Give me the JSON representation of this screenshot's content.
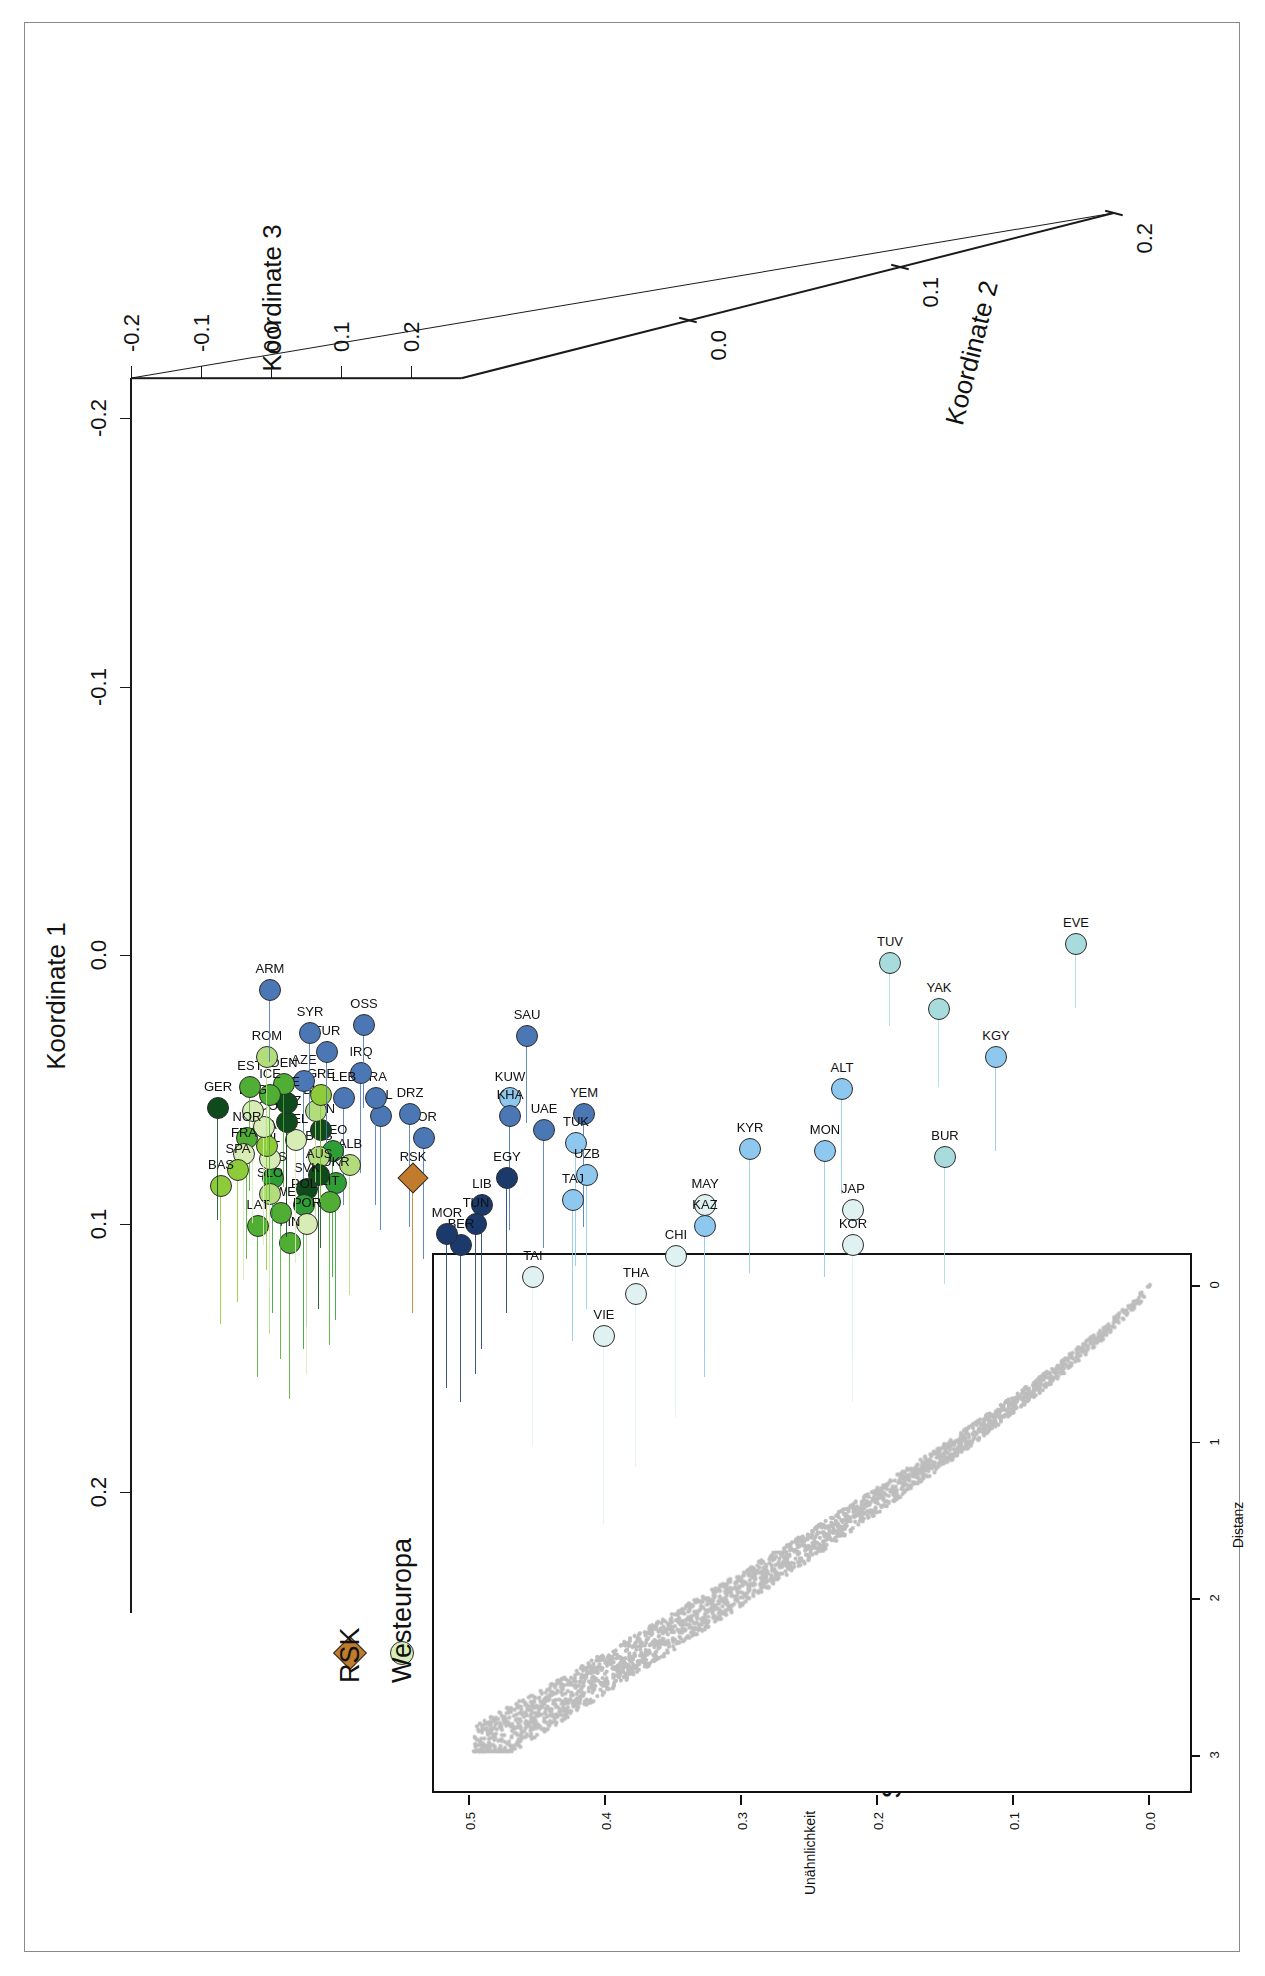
{
  "panel": {
    "letter": "b"
  },
  "axes": {
    "x_title": "Koordinate 1",
    "y_title": "Koordinate 2",
    "z_title": "Koordinate 3",
    "x_ticks": [
      "-0.2",
      "-0.1",
      "0.0",
      "0.1",
      "0.2"
    ],
    "y_ticks": [
      "0.0",
      "0.1",
      "0.2"
    ],
    "z_ticks": [
      "-0.2",
      "-0.1",
      "0.0",
      "0.1",
      "0.2"
    ]
  },
  "inset": {
    "stress_label": "Stress – 0.09158",
    "x_title": "Unähnlichkeit",
    "y_title": "Distanz",
    "x_ticks": [
      "0.0",
      "0.1",
      "0.2",
      "0.3",
      "0.4",
      "0.5"
    ],
    "y_ticks": [
      "0",
      "1",
      "2",
      "3"
    ]
  },
  "legend": {
    "items": [
      {
        "label": "Nordafrika",
        "color": "#1b3a6b"
      },
      {
        "label": "Südwestasien",
        "color": "#4b77b5"
      },
      {
        "label": "Zentralasien",
        "color": "#8ec8ef"
      },
      {
        "label": "Nordasien",
        "color": "#a8dcdc"
      },
      {
        "label": "Südostasien",
        "color": "#dff1f1"
      },
      {
        "label": "Zentraleuropa",
        "color": "#0f4a1c"
      },
      {
        "label": "Osteuropa",
        "color": "#2f9e35"
      },
      {
        "label": "Nordeuropa",
        "color": "#4fae33"
      },
      {
        "label": "Südeuropa",
        "color": "#8dcb3a"
      },
      {
        "label": "Südosteuropa",
        "color": "#b3dd7d"
      },
      {
        "label": "Westeuropa",
        "color": "#d8edb6"
      },
      {
        "label": "RSK",
        "color": "#c07b2c",
        "shape": "diamond"
      }
    ]
  },
  "chart_data": {
    "type": "scatter",
    "title": "",
    "xlabel": "Koordinate 1",
    "ylabel": "Koordinate 2",
    "zlabel": "Koordinate 3",
    "xlim": [
      -0.22,
      0.28
    ],
    "ylim": [
      -0.06,
      0.215
    ],
    "grid": false,
    "legend_position": "bottom-left",
    "points": [
      {
        "code": "EVE",
        "x": -0.004,
        "y": 0.196,
        "group": "Nordasien"
      },
      {
        "code": "KGY",
        "x": 0.038,
        "y": 0.168,
        "group": "Zentralasien"
      },
      {
        "code": "YAK",
        "x": 0.02,
        "y": 0.148,
        "group": "Nordasien"
      },
      {
        "code": "TUV",
        "x": 0.003,
        "y": 0.131,
        "group": "Nordasien"
      },
      {
        "code": "BUR",
        "x": 0.075,
        "y": 0.15,
        "group": "Nordasien"
      },
      {
        "code": "ALT",
        "x": 0.05,
        "y": 0.114,
        "group": "Zentralasien"
      },
      {
        "code": "MON",
        "x": 0.073,
        "y": 0.108,
        "group": "Zentralasien"
      },
      {
        "code": "JAP",
        "x": 0.095,
        "y": 0.118,
        "group": "Südostasien"
      },
      {
        "code": "KOR",
        "x": 0.108,
        "y": 0.118,
        "group": "Südostasien"
      },
      {
        "code": "KYR",
        "x": 0.072,
        "y": 0.082,
        "group": "Zentralasien"
      },
      {
        "code": "MAY",
        "x": 0.093,
        "y": 0.066,
        "group": "Südostasien"
      },
      {
        "code": "KAZ",
        "x": 0.101,
        "y": 0.066,
        "group": "Zentralasien"
      },
      {
        "code": "CHI",
        "x": 0.112,
        "y": 0.056,
        "group": "Südostasien"
      },
      {
        "code": "THA",
        "x": 0.126,
        "y": 0.042,
        "group": "Südostasien"
      },
      {
        "code": "VIE",
        "x": 0.142,
        "y": 0.031,
        "group": "Südostasien"
      },
      {
        "code": "YEM",
        "x": 0.059,
        "y": 0.024,
        "group": "Südwestasien"
      },
      {
        "code": "TUK",
        "x": 0.07,
        "y": 0.021,
        "group": "Zentralasien"
      },
      {
        "code": "UZB",
        "x": 0.082,
        "y": 0.025,
        "group": "Zentralasien"
      },
      {
        "code": "TAJ",
        "x": 0.091,
        "y": 0.02,
        "group": "Zentralasien"
      },
      {
        "code": "UAE",
        "x": 0.065,
        "y": 0.01,
        "group": "Südwestasien"
      },
      {
        "code": "SAU",
        "x": 0.03,
        "y": 0.004,
        "group": "Südwestasien"
      },
      {
        "code": "TAI",
        "x": 0.12,
        "y": 0.006,
        "group": "Südostasien"
      },
      {
        "code": "KUW",
        "x": 0.053,
        "y": -0.002,
        "group": "Zentralasien"
      },
      {
        "code": "KHA",
        "x": 0.06,
        "y": -0.002,
        "group": "Südwestasien"
      },
      {
        "code": "EGY",
        "x": 0.083,
        "y": -0.003,
        "group": "Nordafrika"
      },
      {
        "code": "LIB",
        "x": 0.093,
        "y": -0.012,
        "group": "Nordafrika"
      },
      {
        "code": "TUN",
        "x": 0.1,
        "y": -0.014,
        "group": "Nordafrika"
      },
      {
        "code": "BER",
        "x": 0.108,
        "y": -0.019,
        "group": "Nordafrika"
      },
      {
        "code": "MOR",
        "x": 0.104,
        "y": -0.024,
        "group": "Nordafrika"
      },
      {
        "code": "JOR",
        "x": 0.068,
        "y": -0.032,
        "group": "Südwestasien"
      },
      {
        "code": "DRZ",
        "x": 0.059,
        "y": -0.037,
        "group": "Südwestasien"
      },
      {
        "code": "RSK",
        "x": 0.083,
        "y": -0.036,
        "group": "RSK",
        "shape": "diamond"
      },
      {
        "code": "PAL",
        "x": 0.06,
        "y": -0.047,
        "group": "Südwestasien"
      },
      {
        "code": "IRA",
        "x": 0.053,
        "y": -0.049,
        "group": "Südwestasien"
      },
      {
        "code": "IRQ",
        "x": 0.044,
        "y": -0.054,
        "group": "Südwestasien"
      },
      {
        "code": "OSS",
        "x": 0.026,
        "y": -0.053,
        "group": "Südwestasien"
      },
      {
        "code": "LEB",
        "x": 0.053,
        "y": -0.06,
        "group": "Südwestasien"
      },
      {
        "code": "ALB",
        "x": 0.078,
        "y": -0.058,
        "group": "Südosteuropa"
      },
      {
        "code": "GEO",
        "x": 0.073,
        "y": -0.064,
        "group": "Osteuropa"
      },
      {
        "code": "UKR",
        "x": 0.085,
        "y": -0.063,
        "group": "Osteuropa"
      },
      {
        "code": "LIT",
        "x": 0.092,
        "y": -0.065,
        "group": "Nordeuropa"
      },
      {
        "code": "BOS",
        "x": 0.075,
        "y": -0.069,
        "group": "Südosteuropa"
      },
      {
        "code": "AUS",
        "x": 0.082,
        "y": -0.069,
        "group": "Zentraleuropa"
      },
      {
        "code": "HUN",
        "x": 0.065,
        "y": -0.068,
        "group": "Zentraleuropa"
      },
      {
        "code": "BUL",
        "x": 0.058,
        "y": -0.07,
        "group": "Südosteuropa"
      },
      {
        "code": "GRE",
        "x": 0.052,
        "y": -0.068,
        "group": "Südeuropa"
      },
      {
        "code": "TUR",
        "x": 0.036,
        "y": -0.066,
        "group": "Südwestasien"
      },
      {
        "code": "AZE",
        "x": 0.047,
        "y": -0.074,
        "group": "Südwestasien"
      },
      {
        "code": "SYR",
        "x": 0.029,
        "y": -0.072,
        "group": "Südwestasien"
      },
      {
        "code": "SVK",
        "x": 0.087,
        "y": -0.073,
        "group": "Zentraleuropa"
      },
      {
        "code": "POL",
        "x": 0.093,
        "y": -0.074,
        "group": "Osteuropa"
      },
      {
        "code": "POR",
        "x": 0.1,
        "y": -0.073,
        "group": "Westeuropa"
      },
      {
        "code": "FIN",
        "x": 0.107,
        "y": -0.079,
        "group": "Nordeuropa"
      },
      {
        "code": "BEL",
        "x": 0.069,
        "y": -0.077,
        "group": "Westeuropa"
      },
      {
        "code": "SWZ",
        "x": 0.062,
        "y": -0.08,
        "group": "Zentraleuropa"
      },
      {
        "code": "CZE",
        "x": 0.055,
        "y": -0.08,
        "group": "Zentraleuropa"
      },
      {
        "code": "DEN",
        "x": 0.048,
        "y": -0.081,
        "group": "Nordeuropa"
      },
      {
        "code": "SWE",
        "x": 0.096,
        "y": -0.082,
        "group": "Nordeuropa"
      },
      {
        "code": "RUS",
        "x": 0.083,
        "y": -0.085,
        "group": "Osteuropa"
      },
      {
        "code": "SLO",
        "x": 0.089,
        "y": -0.086,
        "group": "Südosteuropa"
      },
      {
        "code": "LAT",
        "x": 0.101,
        "y": -0.09,
        "group": "Nordeuropa"
      },
      {
        "code": "IRL",
        "x": 0.076,
        "y": -0.086,
        "group": "Westeuropa"
      },
      {
        "code": "ITA",
        "x": 0.071,
        "y": -0.087,
        "group": "Südeuropa"
      },
      {
        "code": "SCO",
        "x": 0.064,
        "y": -0.088,
        "group": "Westeuropa"
      },
      {
        "code": "ICE",
        "x": 0.052,
        "y": -0.086,
        "group": "Nordeuropa"
      },
      {
        "code": "ENG",
        "x": 0.058,
        "y": -0.092,
        "group": "Westeuropa"
      },
      {
        "code": "EST",
        "x": 0.049,
        "y": -0.093,
        "group": "Nordeuropa"
      },
      {
        "code": "ROM",
        "x": 0.038,
        "y": -0.087,
        "group": "Südosteuropa"
      },
      {
        "code": "ARM",
        "x": 0.013,
        "y": -0.086,
        "group": "Südwestasien"
      },
      {
        "code": "NOR",
        "x": 0.068,
        "y": -0.094,
        "group": "Nordeuropa"
      },
      {
        "code": "FRA",
        "x": 0.074,
        "y": -0.095,
        "group": "Westeuropa"
      },
      {
        "code": "SPA",
        "x": 0.08,
        "y": -0.097,
        "group": "Südeuropa"
      },
      {
        "code": "BAS",
        "x": 0.086,
        "y": -0.103,
        "group": "Südeuropa"
      },
      {
        "code": "GER",
        "x": 0.057,
        "y": -0.104,
        "group": "Zentraleuropa"
      }
    ]
  }
}
